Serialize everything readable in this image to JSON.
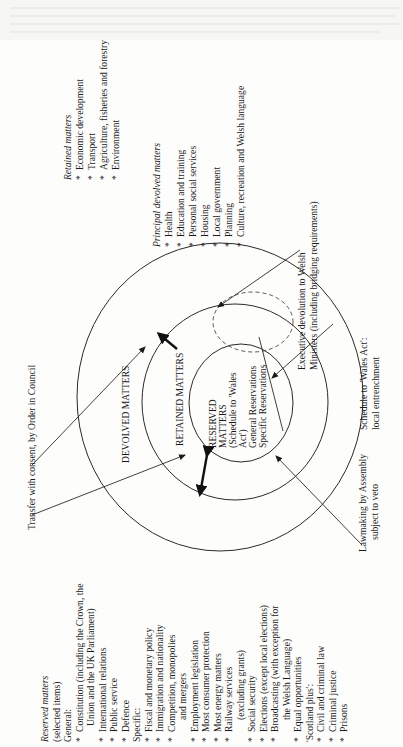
{
  "diagram": {
    "orientation": "rotated 90 degrees counter-clockwise",
    "circles": {
      "outer_label": "DEVOLVED MATTERS",
      "middle_label": "RETAINED MATTERS",
      "inner_lines": [
        "RESERVED",
        "MATTERS",
        "(Schedule to 'Wales",
        "Act')",
        "General Reservations",
        "Specific Reservations"
      ]
    },
    "annotations": {
      "transfer": "Transfer with consent, by Order in Council",
      "executive": [
        "Executive devolution to Welsh",
        "Ministers (including bridging requirements)"
      ],
      "schedule": [
        "Schedule to 'Wales Act':",
        "local entrenchment"
      ],
      "lawmaking": [
        "Lawmaking by Assembly",
        "subject to veto"
      ]
    },
    "retained_matters": {
      "heading": "Retained matters",
      "items": [
        "Economic development",
        "Transport",
        "Agriculture, fisheries and forestry",
        "Environment"
      ]
    },
    "principal_devolved_matters": {
      "heading": "Principal devolved matters",
      "items": [
        "Health",
        "Education and training",
        "Personal social services",
        "Housing",
        "Local government",
        "Planning",
        "Culture, recreation and Welsh language"
      ]
    },
    "reserved_matters": {
      "heading": "Reserved matters",
      "subheading": "(selected items)",
      "general_label": "General:",
      "general_items": [
        [
          "Constitution (including the Crown, the",
          "Union and the UK Parliament)"
        ],
        [
          "International relations"
        ],
        [
          "Public service"
        ],
        [
          "Defence"
        ]
      ],
      "specific_label": "Specific:",
      "specific_items": [
        [
          "Fiscal and monetary policy"
        ],
        [
          "Immigration and nationality"
        ],
        [
          "Competition, monopolies",
          "and mergers"
        ],
        [
          "Employment legislation"
        ],
        [
          "Most consumer protection"
        ],
        [
          "Most energy matters"
        ],
        [
          "Railway services",
          "(excluding grants)"
        ],
        [
          "Social security"
        ],
        [
          "Elections (except local elections)"
        ],
        [
          "Broadcasting (with exception for",
          "the Welsh Language)"
        ],
        [
          "Equal opportunities"
        ]
      ],
      "scotland_label": "'Scotland plus':",
      "scotland_items": [
        [
          "Civil and criminal law"
        ],
        [
          "Criminal justice"
        ],
        [
          "Prisons"
        ]
      ]
    },
    "bullet": "*"
  }
}
